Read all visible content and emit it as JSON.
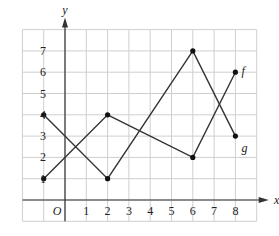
{
  "chart_data": {
    "type": "line",
    "title": "",
    "xlabel": "x",
    "ylabel": "y",
    "origin_label": "O",
    "xlim": [
      -2,
      9
    ],
    "ylim": [
      -1,
      8
    ],
    "grid": true,
    "x_ticks": [
      1,
      2,
      3,
      4,
      5,
      6,
      7,
      8
    ],
    "y_ticks": [
      1,
      2,
      3,
      4,
      5,
      6,
      7
    ],
    "series": [
      {
        "name": "f",
        "points": [
          [
            -1,
            1
          ],
          [
            2,
            4
          ],
          [
            6,
            2
          ],
          [
            8,
            6
          ]
        ],
        "label_at": [
          8,
          6
        ]
      },
      {
        "name": "g",
        "points": [
          [
            -1,
            4
          ],
          [
            2,
            1
          ],
          [
            6,
            7
          ],
          [
            8,
            3
          ]
        ],
        "label_at": [
          8,
          3
        ]
      }
    ],
    "colors": {
      "line": "#333333",
      "grid": "#cfcfcf",
      "axis": "#333333"
    }
  }
}
